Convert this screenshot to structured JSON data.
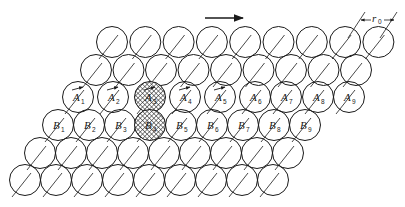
{
  "diagram": {
    "type": "close-packed atomic plane with edge dislocation glide",
    "direction_arrow": {
      "label": "",
      "from": [
        205,
        18
      ],
      "to": [
        243,
        18
      ]
    },
    "dimension": {
      "label": "r",
      "subscript": "0"
    },
    "rows": [
      {
        "y": 42,
        "x0": 112,
        "dx": 33.3,
        "count": 9
      },
      {
        "y": 70,
        "x0": 96,
        "dx": 32.5,
        "count": 9
      },
      {
        "y": 97,
        "x0": 78,
        "dx": 33.8,
        "count": 9,
        "labels": [
          "A1",
          "A2",
          "A3",
          "A4",
          "A5",
          "A6",
          "A7",
          "A8",
          "A9"
        ]
      },
      {
        "y": 125,
        "x0": 58,
        "dx": 31.2,
        "count": 9,
        "labels": [
          "B1",
          "B2",
          "B3",
          "B4",
          "B5",
          "B6",
          "B7",
          "B8",
          "B9"
        ]
      },
      {
        "y": 153,
        "x0": 40,
        "dx": 31,
        "count": 9
      },
      {
        "y": 180,
        "x0": 25,
        "dx": 31,
        "count": 9
      }
    ],
    "atoms_A": [
      {
        "letter": "A",
        "sub": "1",
        "x": 78,
        "arrow": true
      },
      {
        "letter": "A",
        "sub": "2",
        "x": 113,
        "arrow": true
      },
      {
        "letter": "A",
        "sub": "3",
        "x": 150,
        "arrow": true,
        "hatched": true
      },
      {
        "letter": "A",
        "sub": "4",
        "x": 185,
        "arrow": true
      },
      {
        "letter": "A",
        "sub": "5",
        "x": 220,
        "arrow": true
      },
      {
        "letter": "A",
        "sub": "6",
        "x": 255
      },
      {
        "letter": "A",
        "sub": "7",
        "x": 286
      },
      {
        "letter": "A",
        "sub": "8",
        "x": 318
      },
      {
        "letter": "A",
        "sub": "9",
        "x": 349
      }
    ],
    "atoms_B": [
      {
        "letter": "B",
        "sub": "1",
        "x": 58
      },
      {
        "letter": "B",
        "sub": "2",
        "x": 89
      },
      {
        "letter": "B",
        "sub": "3",
        "x": 120
      },
      {
        "letter": "B",
        "sub": "4",
        "x": 150,
        "hatched": true
      },
      {
        "letter": "B",
        "sub": "5",
        "x": 181
      },
      {
        "letter": "B",
        "sub": "6",
        "x": 212
      },
      {
        "letter": "B",
        "sub": "7",
        "x": 243
      },
      {
        "letter": "B",
        "sub": "8",
        "x": 274
      },
      {
        "letter": "B",
        "sub": "9",
        "x": 305
      }
    ],
    "atom_radius": 15.5
  }
}
